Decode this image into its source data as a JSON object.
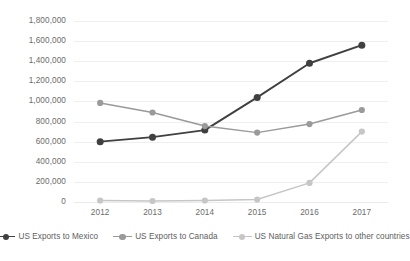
{
  "chart_data": {
    "type": "line",
    "title": "",
    "subtitle": "",
    "xlabel": "",
    "ylabel": "",
    "categories": [
      "2012",
      "2013",
      "2014",
      "2015",
      "2016",
      "2017"
    ],
    "x": [
      2012,
      2013,
      2014,
      2015,
      2016,
      2017
    ],
    "ylim": [
      0,
      1800000
    ],
    "ytick_step": 200000,
    "ytick_labels": [
      "1,800,000",
      "1,600,000",
      "1,400,000",
      "1,200,000",
      "1,000,000",
      "800,000",
      "600,000",
      "400,000",
      "200,000",
      "0"
    ],
    "ytick_values": [
      1800000,
      1600000,
      1400000,
      1200000,
      1000000,
      800000,
      600000,
      400000,
      200000,
      0
    ],
    "grid": true,
    "grid_axis": "y",
    "legend_position": "bottom",
    "markers": "circle",
    "series": [
      {
        "name": "US Exports to Mexico",
        "color": "#404040",
        "values": [
          600000,
          645000,
          715000,
          1040000,
          1380000,
          1560000
        ]
      },
      {
        "name": "US Exports to Canada",
        "color": "#9a9a9a",
        "values": [
          985000,
          890000,
          755000,
          690000,
          775000,
          915000
        ]
      },
      {
        "name": "US Natural Gas Exports to other countries",
        "color": "#c6c6c6",
        "values": [
          15000,
          10000,
          15000,
          25000,
          190000,
          700000
        ]
      }
    ]
  },
  "legend": {
    "items": [
      {
        "label": "US Exports to Mexico"
      },
      {
        "label": "US Exports to Canada"
      },
      {
        "label": "US Natural Gas Exports to other countries"
      }
    ]
  },
  "colors": {
    "series_mexico": "#404040",
    "series_canada": "#9a9a9a",
    "series_natural_gas": "#c6c6c6",
    "gridline": "#efefef",
    "text": "#6b6b6b",
    "background": "#ffffff"
  }
}
